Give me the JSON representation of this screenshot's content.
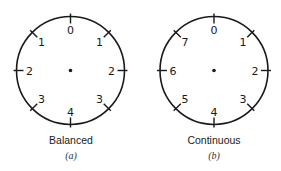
{
  "dials": [
    {
      "id": "a",
      "caption": "Balanced",
      "sublabel": "(a)",
      "center": [
        70.5,
        70.5
      ],
      "radius": 54,
      "positions": [
        {
          "angle": 0,
          "label": "0"
        },
        {
          "angle": 45,
          "label": "1"
        },
        {
          "angle": 90,
          "label": "2"
        },
        {
          "angle": 135,
          "label": "3"
        },
        {
          "angle": 180,
          "label": "4"
        },
        {
          "angle": 225,
          "label": "3"
        },
        {
          "angle": 270,
          "label": "2"
        },
        {
          "angle": 315,
          "label": "1"
        }
      ]
    },
    {
      "id": "b",
      "caption": "Continuous",
      "sublabel": "(b)",
      "center": [
        214,
        70.5
      ],
      "radius": 54,
      "positions": [
        {
          "angle": 0,
          "label": "0"
        },
        {
          "angle": 45,
          "label": "1"
        },
        {
          "angle": 90,
          "label": "2"
        },
        {
          "angle": 135,
          "label": "3"
        },
        {
          "angle": 180,
          "label": "4"
        },
        {
          "angle": 225,
          "label": "5"
        },
        {
          "angle": 270,
          "label": "6"
        },
        {
          "angle": 315,
          "label": "7"
        }
      ]
    }
  ],
  "style": {
    "stroke_color": "#1a1a1a",
    "text_color": "#1a1a1a"
  }
}
